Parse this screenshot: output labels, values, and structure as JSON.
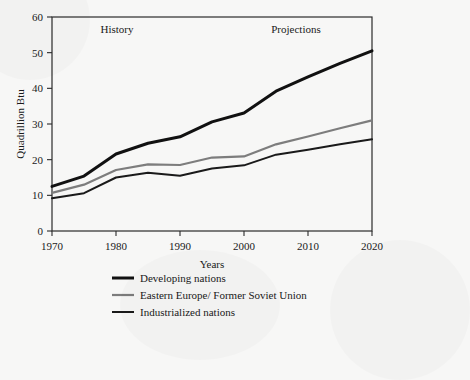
{
  "chart_data": {
    "type": "line",
    "title": "",
    "subtitle": "",
    "xlabel": "Years",
    "ylabel": "Quadrillion Btu",
    "xlim": [
      1970,
      2020
    ],
    "ylim": [
      0,
      60
    ],
    "xticks": [
      1970,
      1980,
      1990,
      2000,
      2010,
      2020
    ],
    "yticks": [
      0,
      10,
      20,
      30,
      40,
      50,
      60
    ],
    "grid": false,
    "legend_position": "bottom",
    "x": [
      1970,
      1975,
      1980,
      1985,
      1990,
      1995,
      2000,
      2005,
      2010,
      2015,
      2020
    ],
    "series": [
      {
        "name": "Developing nations",
        "color": "#111111",
        "width": 3.0,
        "values": [
          12.5,
          15.4,
          21.6,
          24.6,
          26.4,
          30.6,
          33.1,
          39.2,
          43.2,
          47.0,
          50.5
        ]
      },
      {
        "name": "Eastern Europe/ Former Soviet Union",
        "color": "#7d7d7d",
        "width": 2.2,
        "values": [
          10.7,
          13.0,
          17.1,
          18.7,
          18.5,
          20.6,
          20.9,
          24.3,
          26.5,
          28.8,
          31.0
        ]
      },
      {
        "name": "Industrialized nations",
        "color": "#1a1a1a",
        "width": 2.0,
        "values": [
          9.2,
          10.6,
          15.0,
          16.3,
          15.5,
          17.5,
          18.4,
          21.4,
          22.8,
          24.3,
          25.7
        ]
      }
    ],
    "annotations": [
      {
        "text": "History",
        "x": 1982,
        "y": 56.5
      },
      {
        "text": "Projections",
        "x": 2008,
        "y": 56.5
      }
    ]
  },
  "annotations": {
    "history": "History",
    "projections": "Projections"
  },
  "axes": {
    "ylabel": "Quadrillion Btu",
    "xlabel": "Years",
    "xtick_labels": [
      "1970",
      "1980",
      "1990",
      "2000",
      "2010",
      "2020"
    ],
    "ytick_labels": [
      "0",
      "10",
      "20",
      "30",
      "40",
      "50",
      "60"
    ]
  },
  "legend": {
    "items": [
      {
        "label": "Developing nations",
        "color": "#111111"
      },
      {
        "label": "Eastern Europe/ Former Soviet Union",
        "color": "#7d7d7d"
      },
      {
        "label": "Industrialized nations",
        "color": "#1a1a1a"
      }
    ]
  },
  "colors": {
    "background": "#f7f7f6",
    "frame": "#2b2b2b",
    "text": "#1a1a1a"
  }
}
